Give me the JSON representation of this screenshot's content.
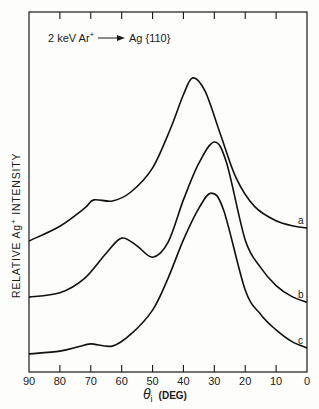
{
  "chart_data": {
    "type": "line",
    "annotation": {
      "prefix": "2 keV Ar",
      "sup": "+",
      "target": "Ag {110}"
    },
    "xlabel": "θi (DEG)",
    "xlabel_parts": {
      "symbol": "θ",
      "sub": "i",
      "unit": "(DEG)"
    },
    "ylabel": "RELATIVE Ag+ INTENSITY",
    "ylabel_parts": {
      "pre": "RELATIVE Ag",
      "sup": "+",
      "post": " INTENSITY"
    },
    "xlim": [
      90,
      0
    ],
    "ylim": [
      0,
      100
    ],
    "x_reversed": true,
    "x_ticks": [
      90,
      80,
      70,
      60,
      50,
      40,
      30,
      20,
      10,
      0
    ],
    "y_ticks": [],
    "grid": false,
    "legend": "inline curve labels at right edge",
    "series": [
      {
        "name": "a",
        "x": [
          90,
          80,
          72,
          69,
          63,
          57,
          50,
          44,
          40,
          37,
          33,
          28,
          23,
          17,
          10,
          4,
          0
        ],
        "values": [
          36.4,
          40.5,
          45.5,
          47.8,
          47.5,
          50,
          56.7,
          68,
          77,
          81.7,
          78,
          66,
          54,
          46,
          42,
          40.5,
          40
        ]
      },
      {
        "name": "b",
        "x": [
          90,
          80,
          72,
          65,
          60,
          55,
          50,
          45,
          40,
          35,
          30,
          26,
          20,
          15,
          10,
          5,
          0
        ],
        "values": [
          20.8,
          22,
          26,
          33,
          37.2,
          35,
          31.9,
          36,
          47.8,
          58,
          63.9,
          58,
          36.7,
          29,
          24,
          21,
          19.4
        ]
      },
      {
        "name": "c",
        "x": [
          90,
          80,
          74,
          70,
          63,
          57,
          50,
          45,
          40,
          35,
          31,
          27,
          20,
          15,
          10,
          5,
          0
        ],
        "values": [
          5,
          5.8,
          7,
          7.8,
          7.2,
          10.5,
          17.2,
          26,
          36.7,
          45.5,
          49.7,
          45,
          22.8,
          16,
          11.7,
          8.5,
          6.7
        ]
      }
    ]
  }
}
